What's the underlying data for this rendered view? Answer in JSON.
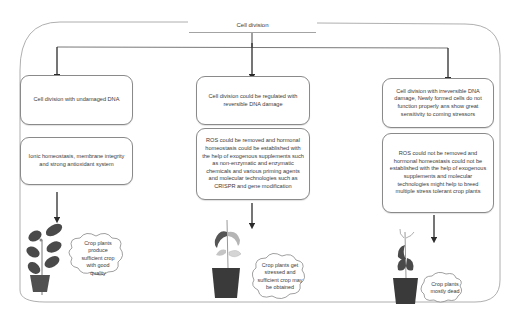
{
  "title": "Cell division",
  "branches": [
    {
      "id": "undamaged",
      "condition": "Cell division with undamaged DNA",
      "mechanism": "Ionic homeostasis, membrane integrity and strong antioxidant system",
      "outcome": "Crop plants produce sufficient crop with good quality",
      "plant_state": "healthy-plant"
    },
    {
      "id": "reversible",
      "condition": "Cell division could be regulated with reversible DNA damage",
      "mechanism": "ROS could be removed  and hormonal homeostasis could be established with the help of exogenous supplements such as non-enzymatic  and enzymatic chemicals and various priming agents and molecular  technologies such as CRISPR and gene modification",
      "outcome": "Crop plants get stressed and sufficient crop may be obtained",
      "plant_state": "stressed-plant"
    },
    {
      "id": "irreversible",
      "condition": "Cell division with irreversible DNA damage, Newly formed  cells do not function properly ans show great sensitivity to coming stressors",
      "mechanism": "ROS could not be removed  and hormonal  homeostasis could not be established with the help of exogenous supplements and molecular technologies might help to breed multiple stress tolerant crop plants",
      "outcome": "Crop plants mostly dead",
      "plant_state": "dead-plant"
    }
  ],
  "colors": {
    "line": "#8c8c8c",
    "arrow": "#2b2b2b",
    "pot": "#3a3a3a",
    "leaf_dark": "#4a4a4a",
    "leaf_light": "#b5b5b5"
  }
}
